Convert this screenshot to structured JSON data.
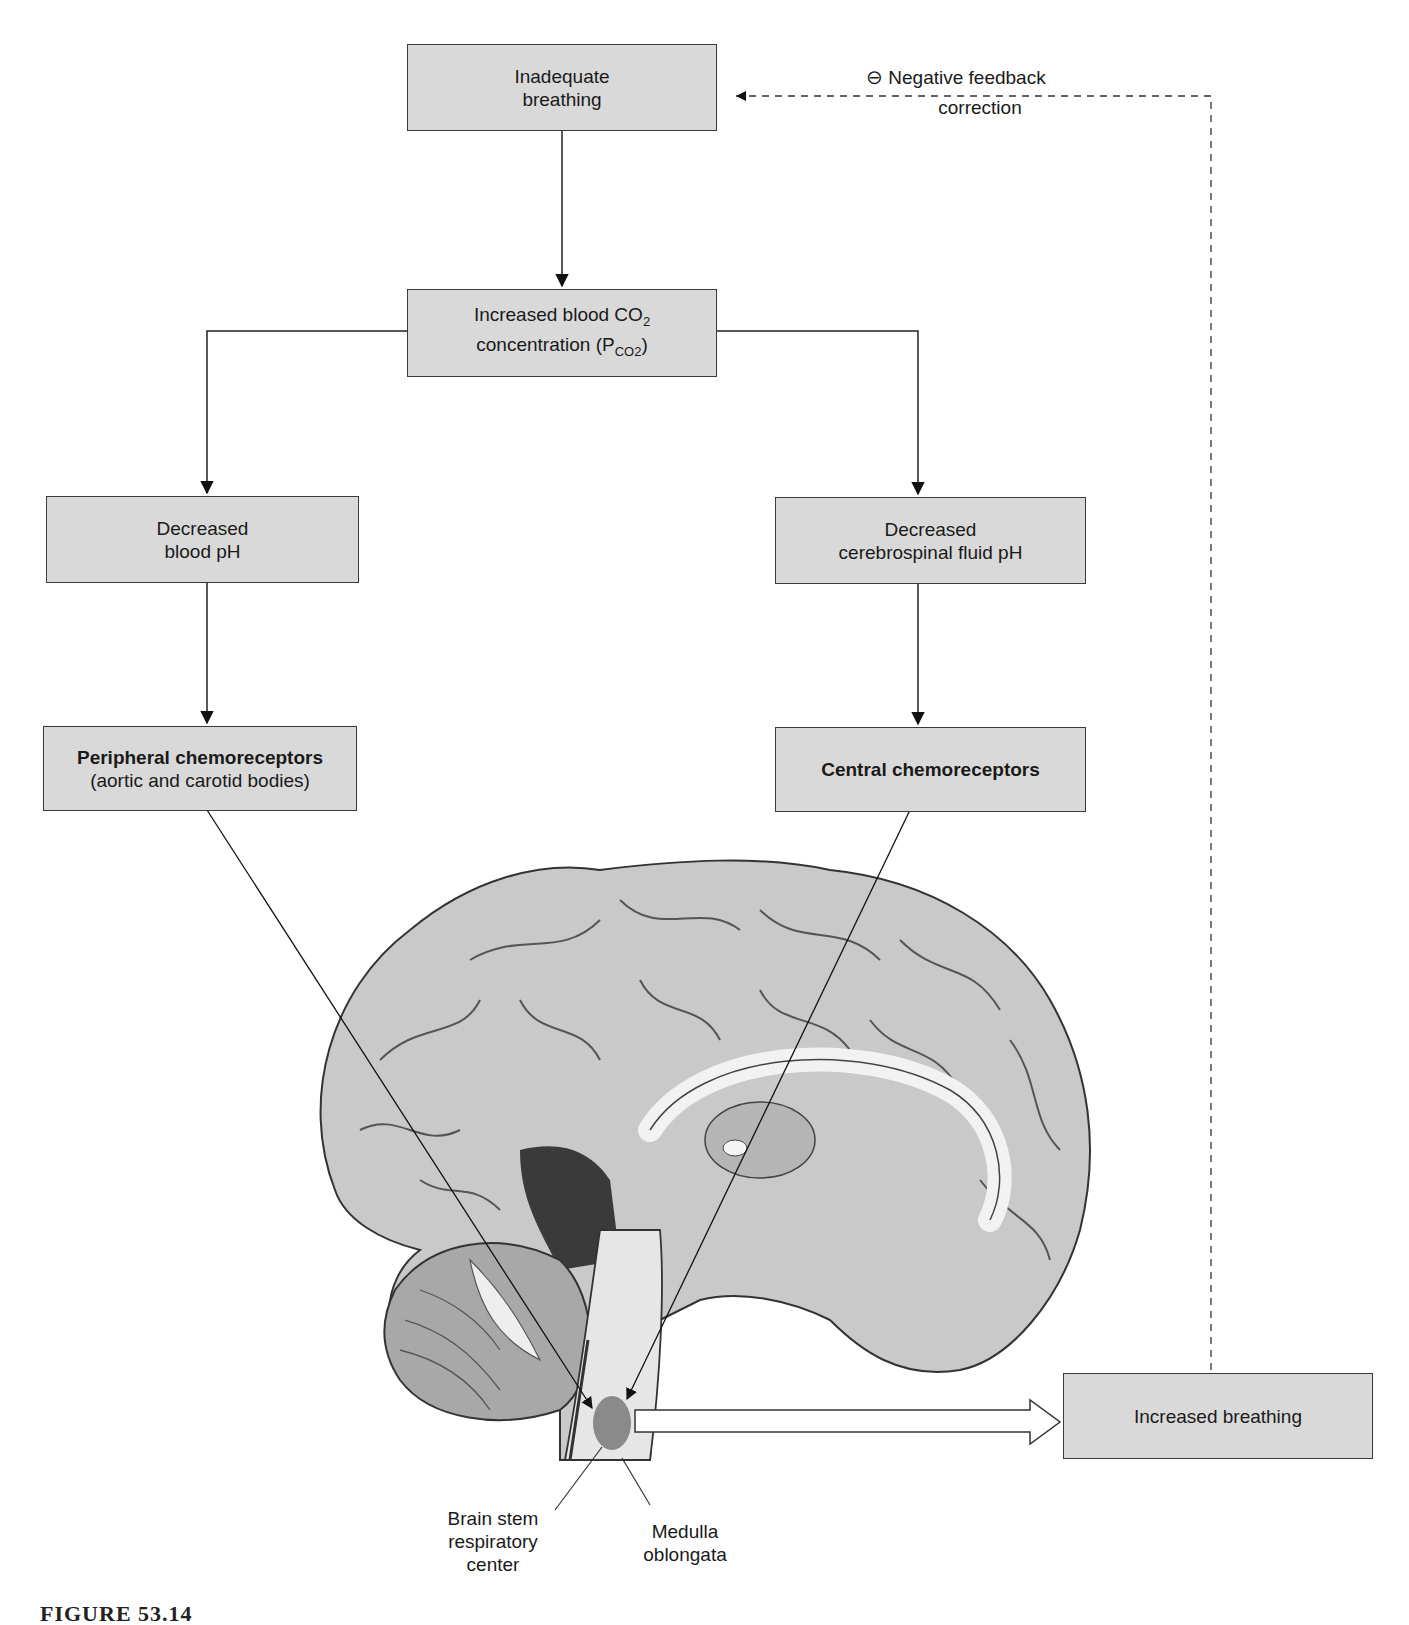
{
  "diagram": {
    "type": "flowchart",
    "nodes": {
      "inadequate_breathing": {
        "lines": [
          "Inadequate",
          "breathing"
        ]
      },
      "increased_co2": {
        "line1_main": "Increased blood CO",
        "line1_sub": "2",
        "line2_main": "concentration (P",
        "line2_sub": "CO2",
        "line2_end": ")"
      },
      "decreased_blood_ph": {
        "lines": [
          "Decreased",
          "blood pH"
        ]
      },
      "decreased_csf_ph": {
        "lines": [
          "Decreased",
          "cerebrospinal fluid pH"
        ]
      },
      "peripheral_chemo": {
        "bold": "Peripheral chemoreceptors",
        "detail": "(aortic and carotid bodies)"
      },
      "central_chemo": {
        "bold": "Central chemoreceptors"
      },
      "increased_breathing": {
        "lines": [
          "Increased breathing"
        ]
      }
    },
    "feedback": {
      "symbol": "⊖",
      "line1": "Negative feedback",
      "line2": "correction"
    },
    "anatomy_labels": {
      "brain_stem": [
        "Brain stem",
        "respiratory",
        "center"
      ],
      "medulla": [
        "Medulla",
        "oblongata"
      ]
    },
    "edges": [
      {
        "from": "inadequate_breathing",
        "to": "increased_co2",
        "style": "solid"
      },
      {
        "from": "increased_co2",
        "to": "decreased_blood_ph",
        "style": "solid"
      },
      {
        "from": "increased_co2",
        "to": "decreased_csf_ph",
        "style": "solid"
      },
      {
        "from": "decreased_blood_ph",
        "to": "peripheral_chemo",
        "style": "solid"
      },
      {
        "from": "decreased_csf_ph",
        "to": "central_chemo",
        "style": "solid"
      },
      {
        "from": "peripheral_chemo",
        "to": "brain_stem_respiratory_center",
        "style": "solid"
      },
      {
        "from": "central_chemo",
        "to": "brain_stem_respiratory_center",
        "style": "solid"
      },
      {
        "from": "brain_stem_respiratory_center",
        "to": "increased_breathing",
        "style": "hollow-arrow"
      },
      {
        "from": "increased_breathing",
        "to": "inadequate_breathing",
        "style": "dashed",
        "label": "Negative feedback correction"
      }
    ],
    "colors": {
      "box_fill": "#d9d9d9",
      "box_border": "#3a3a3a",
      "respiratory_center": "#8a8a8a"
    },
    "caption": "FIGURE 53.14"
  }
}
